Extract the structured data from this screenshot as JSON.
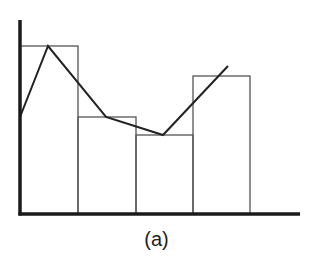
{
  "caption": "(a)",
  "colors": {
    "axis": "#1a1a1a",
    "bar_stroke": "#555555",
    "polygon": "#222222",
    "background": "#ffffff"
  },
  "chart_data": {
    "type": "bar",
    "subtype": "histogram with frequency polygon",
    "title": "",
    "caption": "(a)",
    "xlabel": "",
    "ylabel": "",
    "tick_labels": "none shown",
    "grid": false,
    "legend": "none",
    "categories": [
      "bin1",
      "bin2",
      "bin3",
      "bin4"
    ],
    "values": [
      168,
      97,
      79,
      138
    ],
    "ylim": [
      0,
      194
    ],
    "units": "relative pixel height (no axis scale shown)",
    "series": [
      {
        "name": "histogram",
        "kind": "bar",
        "values": [
          168,
          97,
          79,
          138
        ]
      },
      {
        "name": "frequency polygon",
        "kind": "line",
        "points": [
          [
            0,
            97
          ],
          [
            0.5,
            168
          ],
          [
            1.5,
            97
          ],
          [
            2.5,
            79
          ],
          [
            3.6,
            148
          ]
        ]
      }
    ],
    "layout": {
      "origin": [
        20,
        214
      ],
      "axis_top": 20,
      "axis_right": 300,
      "bar_edges_x": [
        20,
        78,
        136,
        193,
        250
      ],
      "polygon_px": [
        [
          20,
          117
        ],
        [
          48,
          46
        ],
        [
          106,
          117
        ],
        [
          163,
          135
        ],
        [
          228,
          66
        ]
      ]
    }
  }
}
